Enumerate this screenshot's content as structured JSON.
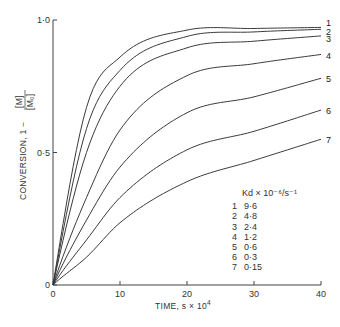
{
  "chart_data": {
    "type": "line",
    "title": "",
    "xlabel": "TIME, s × 10⁴",
    "ylabel": "CONVERSION, 1 − [M]/[M₀]",
    "xlim": [
      0,
      40
    ],
    "ylim": [
      0,
      1.0
    ],
    "x_ticks": [
      0,
      10,
      20,
      30,
      40
    ],
    "x_tick_labels": [
      "0",
      "10",
      "20",
      "30",
      "40"
    ],
    "y_ticks": [
      0,
      0.5,
      1.0
    ],
    "y_tick_labels": [
      "0",
      "0·5",
      "1·0"
    ],
    "grid": false,
    "legend_title": "Kd × 10⁻⁶/s⁻¹",
    "legend_position": "lower right inside",
    "x": [
      0,
      5,
      10,
      20,
      30,
      40
    ],
    "series": [
      {
        "name": "1",
        "kd": "9·6",
        "values": [
          0,
          0.67,
          0.86,
          0.962,
          0.968,
          0.972
        ]
      },
      {
        "name": "2",
        "kd": "4·8",
        "values": [
          0,
          0.59,
          0.81,
          0.938,
          0.955,
          0.965
        ]
      },
      {
        "name": "3",
        "kd": "2·4",
        "values": [
          0,
          0.5,
          0.75,
          0.895,
          0.92,
          0.94
        ]
      },
      {
        "name": "4",
        "kd": "1·2",
        "values": [
          0,
          0.33,
          0.585,
          0.79,
          0.835,
          0.87
        ]
      },
      {
        "name": "5",
        "kd": "0·6",
        "values": [
          0,
          0.245,
          0.445,
          0.65,
          0.71,
          0.78
        ]
      },
      {
        "name": "6",
        "kd": "0·3",
        "values": [
          0,
          0.17,
          0.33,
          0.51,
          0.58,
          0.66
        ]
      },
      {
        "name": "7",
        "kd": "0·15",
        "values": [
          0,
          0.105,
          0.235,
          0.39,
          0.47,
          0.55
        ]
      }
    ]
  },
  "axes": {
    "x_label_main": "TIME, s × 10",
    "x_label_sup": "4",
    "y_label_prefix": "CONVERSION, 1 −",
    "y_frac_num": "[M]",
    "y_frac_den": "[M₀]"
  },
  "legend": {
    "title": "Kd × 10⁻⁶/s⁻¹",
    "rows": [
      {
        "num": "1",
        "kd": "9·6"
      },
      {
        "num": "2",
        "kd": "4·8"
      },
      {
        "num": "3",
        "kd": "2·4"
      },
      {
        "num": "4",
        "kd": "1·2"
      },
      {
        "num": "5",
        "kd": "0·6"
      },
      {
        "num": "6",
        "kd": "0·3"
      },
      {
        "num": "7",
        "kd": "0·15"
      }
    ]
  },
  "colors": {
    "line": "#3a3a3a",
    "axis": "#444444",
    "background": "#ffffff"
  }
}
